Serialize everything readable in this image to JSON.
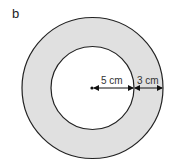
{
  "figure": {
    "label": "b",
    "shape": "annulus",
    "outer_circle": {
      "cx": 92.5,
      "cy": 88,
      "r": 70.5
    },
    "inner_circle": {
      "cx": 92.5,
      "cy": 88,
      "r": 41.5
    },
    "colors": {
      "ring_fill": "#e0e0e0",
      "inner_fill": "#ffffff",
      "stroke": "#222222"
    },
    "dimensions": [
      {
        "label": "5 cm",
        "meaning": "inner radius"
      },
      {
        "label": "3 cm",
        "meaning": "ring width"
      }
    ]
  }
}
